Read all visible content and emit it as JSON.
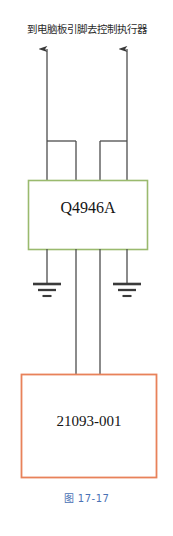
{
  "figure": {
    "header_note": "到电脑板引脚去控制执行器",
    "caption": "图 17-17",
    "caption_color": "#4a72b5",
    "background": "#ffffff"
  },
  "ic_block": {
    "label": "Q4946A",
    "border_color": "#9aba6e",
    "fill_color": "#ffffff",
    "text_color": "#141414"
  },
  "module_block": {
    "label": "21093-001",
    "border_color": "#e8825a",
    "fill_color": "#ffffff",
    "text_color": "#141414"
  },
  "wiring": {
    "line_color": "#4d4d4d",
    "arrow_color": "#3a3a3a",
    "ground_color": "#3a3a3a",
    "arrow_count": 2,
    "ground_count": 2,
    "top_pin_count": 4,
    "bottom_pin_count": 4,
    "interconnect_count": 2
  }
}
